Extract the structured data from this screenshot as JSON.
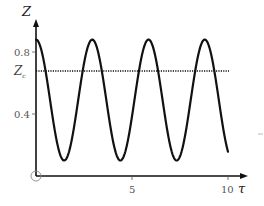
{
  "chart_data": {
    "type": "line",
    "title": "",
    "xlabel": "τ",
    "ylabel": "Z",
    "xlim": [
      0,
      10
    ],
    "ylim": [
      0,
      1.0
    ],
    "grid": false,
    "legend": null,
    "x_ticks": [
      "5",
      "10"
    ],
    "y_ticks": [
      "0.4",
      "0.8"
    ],
    "y_special_tick": "Z_c",
    "origin_label": "O",
    "series": [
      {
        "name": "Z(τ)",
        "style": "solid",
        "color": "#111111",
        "description": "periodic oscillation, peaks ≈0.88 at τ≈0, 2.93, 5.86, 8.79; minima ≈0.10 at τ≈1.46, 4.4, 7.3; ends ≈0.16 at τ=10",
        "x": [
          0,
          0.5,
          1.0,
          1.46,
          2.0,
          2.5,
          2.93,
          3.5,
          4.0,
          4.4,
          5.0,
          5.5,
          5.86,
          6.5,
          7.0,
          7.3,
          8.0,
          8.5,
          8.79,
          9.5,
          10.0
        ],
        "values": [
          0.88,
          0.68,
          0.24,
          0.1,
          0.3,
          0.72,
          0.88,
          0.64,
          0.2,
          0.1,
          0.34,
          0.76,
          0.88,
          0.6,
          0.16,
          0.1,
          0.38,
          0.78,
          0.88,
          0.56,
          0.16
        ]
      },
      {
        "name": "Z_c",
        "style": "dotted",
        "color": "#111111",
        "x": [
          0,
          10
        ],
        "values": [
          0.68,
          0.68
        ]
      }
    ]
  },
  "labels": {
    "y_axis": "Z",
    "x_axis": "τ",
    "tick_5": "5",
    "tick_10": "10",
    "tick_04": "0.4",
    "tick_08": "0.8",
    "zc_main": "Z",
    "zc_sub": "c"
  }
}
